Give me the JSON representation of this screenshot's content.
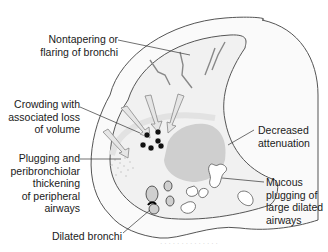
{
  "diagram": {
    "colors": {
      "outline": "#555555",
      "lung_fill": "#f1f1f1",
      "ring_fill": "#fafafa",
      "attenuation_patch": "#cfcfcf",
      "airway_fill": "#ffffff",
      "arrow_fill": "#e6e6e6",
      "dot_fill": "#111111",
      "leader_line": "#333333"
    },
    "labels": {
      "nontapering": "Nontapering or\nflaring of bronchi",
      "crowding": "Crowding with\nassociated loss\nof volume",
      "plugging": "Plugging and\nperibronchiolar\nthickening\nof peripheral\nairways",
      "dilated": "Dilated bronchi",
      "decreased": "Decreased\nattenuation",
      "mucous": "Mucous\nplugging of\nlarge dilated\nairways"
    },
    "caption": "· · · · · · · · · · · · · ·"
  }
}
